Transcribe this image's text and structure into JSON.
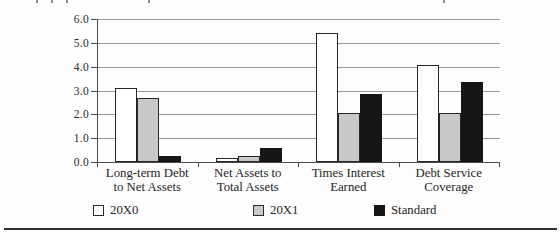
{
  "chart_data": {
    "type": "bar",
    "title": "",
    "xlabel": "",
    "ylabel": "",
    "categories": [
      "Long-term Debt to Net Assets",
      "Net Assets to Total Assets",
      "Times Interest Earned",
      "Debt Service Coverage"
    ],
    "category_label_lines": [
      [
        "Long-term Debt",
        "to Net Assets"
      ],
      [
        "Net Assets to",
        "Total Assets"
      ],
      [
        "Times Interest",
        "Earned"
      ],
      [
        "Debt Service",
        "Coverage"
      ]
    ],
    "series": [
      {
        "name": "20X0",
        "color": "#ffffff",
        "values": [
          3.1,
          0.15,
          5.4,
          4.05
        ]
      },
      {
        "name": "20X1",
        "color": "#c9c9c9",
        "values": [
          2.7,
          0.25,
          2.05,
          2.05
        ]
      },
      {
        "name": "Standard",
        "color": "#161616",
        "values": [
          0.25,
          0.6,
          2.85,
          3.35
        ]
      }
    ],
    "ylim": [
      0,
      6
    ],
    "ytick_step": 1.0,
    "ytick_labels": [
      "0.0",
      "1.0",
      "2.0",
      "3.0",
      "4.0",
      "5.0",
      "6.0"
    ],
    "grid": true,
    "legend_position": "bottom",
    "bar_border_color": "#252525",
    "axis_color": "#4a4a4a",
    "gridline_color": "#9a9a9a"
  },
  "legend": {
    "items": [
      {
        "label": "20X0",
        "color": "#ffffff"
      },
      {
        "label": "20X1",
        "color": "#c9c9c9"
      },
      {
        "label": "Standard",
        "color": "#161616"
      }
    ]
  }
}
